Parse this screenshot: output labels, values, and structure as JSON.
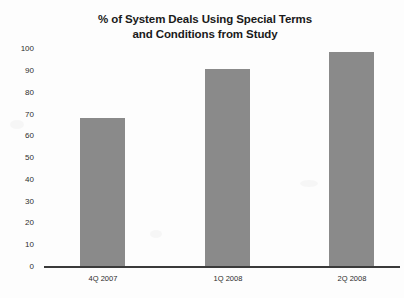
{
  "chart_data": {
    "type": "bar",
    "title": "% of System Deals Using Special Terms and Conditions from Study",
    "title_lines": [
      "% of System Deals Using Special Terms",
      "and Conditions from Study"
    ],
    "categories": [
      "4Q 2007",
      "1Q 2008",
      "2Q 2008"
    ],
    "values": [
      67,
      89,
      97
    ],
    "xlabel": "",
    "ylabel": "",
    "ylim": [
      0,
      100
    ],
    "ytick_step": 10,
    "yticks": [
      "100",
      "90",
      "80",
      "70",
      "60",
      "50",
      "40",
      "30",
      "20",
      "10",
      "0"
    ],
    "grid": false,
    "legend": false,
    "series": [
      {
        "name": "% of System Deals Using Special Terms and Conditions",
        "values": [
          67,
          89,
          97
        ]
      }
    ]
  },
  "style": {
    "bar_color": "#8a8a8a",
    "axis_color": "#3a3a3a",
    "text_color": "#1a1a1a",
    "background": "#fdfdfd"
  }
}
